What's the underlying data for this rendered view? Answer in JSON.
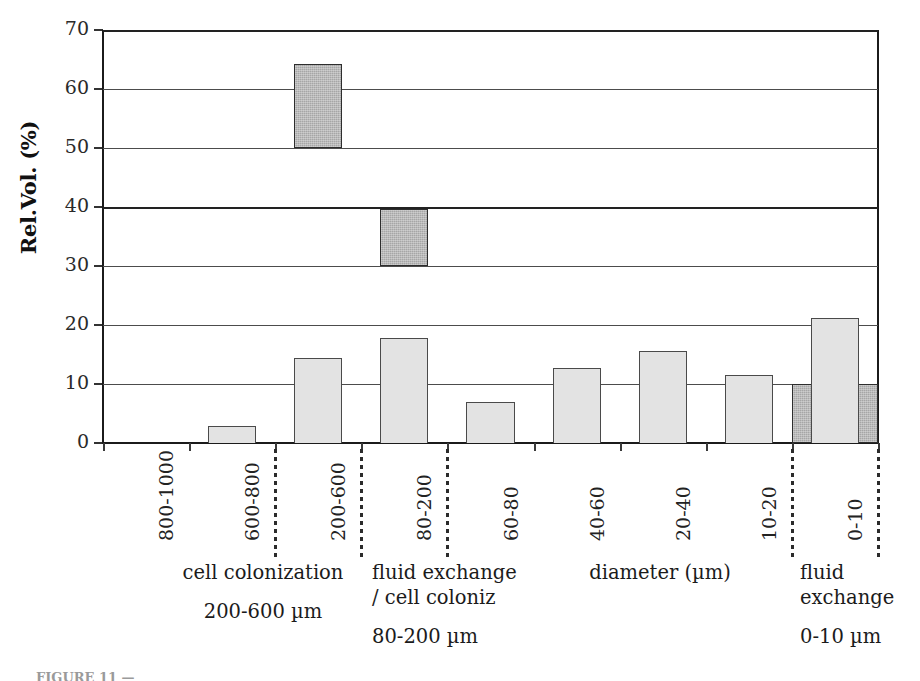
{
  "chart_data": {
    "type": "bar",
    "title": "",
    "xlabel": "diameter (µm)",
    "ylabel": "Rel.Vol. (%)",
    "ylim": [
      0,
      70
    ],
    "ytick_values": [
      0,
      10,
      20,
      30,
      40,
      50,
      60,
      70
    ],
    "ytick_labels": [
      "0",
      "10",
      "20",
      "30",
      "40",
      "50",
      "60",
      "70"
    ],
    "grid": true,
    "legend": "none",
    "categories": [
      "800-1000",
      "600-800",
      "200-600",
      "80-200",
      "60-80",
      "40-60",
      "20-40",
      "10-20",
      "0-10"
    ],
    "series": [
      {
        "name": "Rel.Vol. (%)",
        "values": [
          0,
          2.8,
          14.4,
          17.8,
          7.0,
          12.7,
          15.6,
          11.6,
          21.2
        ]
      }
    ],
    "annotation_boxes": [
      {
        "name": "cell-colonization-box",
        "categories": [
          "200-600"
        ],
        "y_from": 50,
        "y_to": 64.3,
        "label": "cell colonization 200-600 µm"
      },
      {
        "name": "fluid-exchange-cell-coloniz-box",
        "categories": [
          "80-200"
        ],
        "y_from": 30,
        "y_to": 39.6,
        "label": "fluid exchange / cell coloniz 80-200 µm"
      },
      {
        "name": "fluid-exchange-box",
        "categories": [
          "0-10"
        ],
        "y_from": 0,
        "y_to": 10,
        "label": "fluid exchange 0-10 µm"
      }
    ],
    "group_dividers_after": [
      "600-800",
      "200-600",
      "80-200",
      "10-20",
      "0-10"
    ],
    "group_notes": [
      {
        "lines": [
          "cell colonization",
          "200-600 µm"
        ]
      },
      {
        "lines": [
          "fluid exchange",
          "/ cell coloniz",
          "80-200 µm"
        ]
      },
      {
        "lines": [
          "diameter (µm)"
        ]
      },
      {
        "lines": [
          "fluid",
          "exchange",
          "0-10 µm"
        ]
      }
    ],
    "colors": {
      "light_bar_fill": "#e3e3e3",
      "dark_bar_fill": "#a6a6a6",
      "bar_stroke": "#4a4a4a",
      "axis": "#1b1b1b",
      "gridline": "#4c4c4c",
      "text": "#1a1a1a"
    }
  },
  "caption": {
    "text": "FIGURE 11 —"
  }
}
